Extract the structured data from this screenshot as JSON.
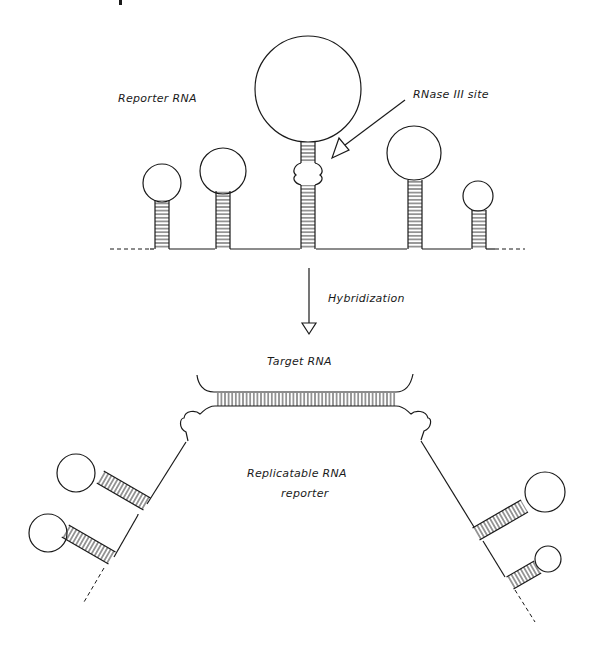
{
  "figure": {
    "top_section": {
      "label": "Reporter RNA",
      "site_label": "RNase III site",
      "hairpins": [
        {
          "name": "hairpin-1",
          "stem_x": 154,
          "loop_r": 19
        },
        {
          "name": "hairpin-2",
          "stem_x": 215,
          "loop_r": 23
        },
        {
          "name": "hairpin-3-rnase-site",
          "stem_x": 300,
          "loop_r": 53
        },
        {
          "name": "hairpin-4",
          "stem_x": 407,
          "loop_r": 27
        },
        {
          "name": "hairpin-5",
          "stem_x": 471,
          "loop_r": 15
        }
      ]
    },
    "transition": {
      "label": "Hybridization"
    },
    "bottom_section": {
      "target_label": "Target RNA",
      "reporter_label_line1": "Replicatable RNA",
      "reporter_label_line2": "reporter"
    }
  }
}
